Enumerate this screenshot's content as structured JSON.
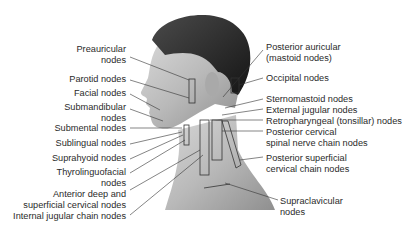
{
  "figure": {
    "left_labels": [
      {
        "id": "preauricular",
        "lines": [
          "Preauricular",
          "nodes"
        ]
      },
      {
        "id": "parotid",
        "lines": [
          "Parotid nodes"
        ]
      },
      {
        "id": "facial",
        "lines": [
          "Facial nodes"
        ]
      },
      {
        "id": "submandibular",
        "lines": [
          "Submandibular",
          "nodes"
        ]
      },
      {
        "id": "submental",
        "lines": [
          "Submental nodes"
        ]
      },
      {
        "id": "sublingual",
        "lines": [
          "Sublingual nodes"
        ]
      },
      {
        "id": "suprahyoid",
        "lines": [
          "Suprahyoid nodes"
        ]
      },
      {
        "id": "thyrolinguofacial",
        "lines": [
          "Thyrolinguofacial",
          "nodes"
        ]
      },
      {
        "id": "anterior-deep",
        "lines": [
          "Anterior deep and",
          "superficial cervical nodes"
        ]
      },
      {
        "id": "internal-jugular",
        "lines": [
          "Internal jugular chain nodes"
        ]
      }
    ],
    "right_labels": [
      {
        "id": "posterior-auricular",
        "lines": [
          "Posterior auricular",
          "(mastoid nodes)"
        ]
      },
      {
        "id": "occipital",
        "lines": [
          "Occipital nodes"
        ]
      },
      {
        "id": "sternomastoid",
        "lines": [
          "Sternomastoid nodes"
        ]
      },
      {
        "id": "external-jugular",
        "lines": [
          "External jugular nodes"
        ]
      },
      {
        "id": "retropharyngeal",
        "lines": [
          "Retropharyngeal (tonsillar) nodes"
        ]
      },
      {
        "id": "posterior-cervical",
        "lines": [
          "Posterior cervical",
          "spinal nerve chain nodes"
        ]
      },
      {
        "id": "posterior-superficial",
        "lines": [
          "Posterior superficial",
          "cervical chain nodes"
        ]
      },
      {
        "id": "supraclavicular",
        "lines": [
          "Supraclavicular",
          "nodes"
        ]
      }
    ]
  }
}
